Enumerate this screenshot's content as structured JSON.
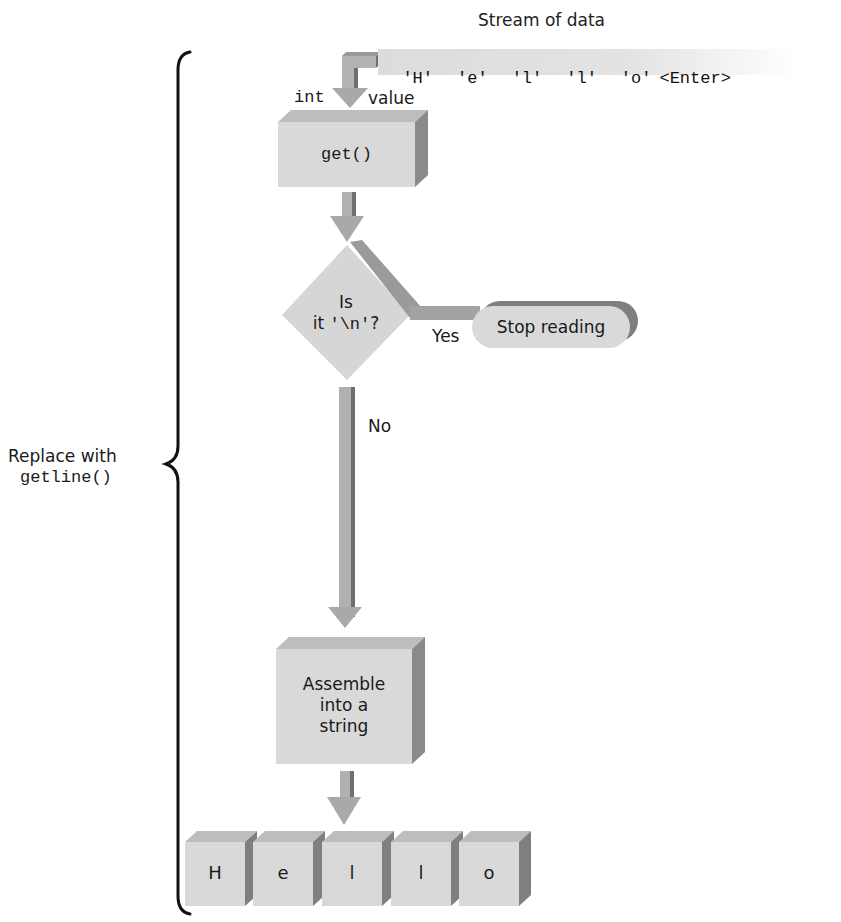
{
  "title": "Stream of data",
  "stream": {
    "items": [
      "'H'",
      "'e'",
      "'l'",
      "'l'",
      "'o'",
      "<Enter>"
    ]
  },
  "input_labels": {
    "type": "int",
    "value": "value"
  },
  "steps": {
    "get": "get()",
    "decision": {
      "line1": "Is",
      "line2_prefix": "it ",
      "line2_code": "'\\n'",
      "line2_suffix": "?"
    },
    "yes_label": "Yes",
    "stop": "Stop reading",
    "no_label": "No",
    "assemble": [
      "Assemble",
      "into a",
      "string"
    ]
  },
  "result": {
    "cells": [
      "H",
      "e",
      "l",
      "l",
      "o"
    ]
  },
  "brace_label": {
    "line1": "Replace with",
    "line2": "getline()"
  },
  "colors": {
    "box_front": "#d9d9d9",
    "box_top": "#bdbdbd",
    "box_side": "#8a8a8a",
    "arrow": "#a8a8a8",
    "arrow_dark": "#6f6f6f",
    "stream_band": "#dedede",
    "brace": "#111111"
  }
}
